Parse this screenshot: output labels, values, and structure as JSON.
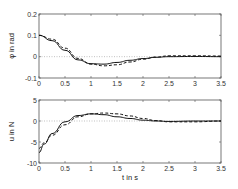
{
  "chart_data": [
    {
      "type": "line",
      "title": "",
      "xlabel": "",
      "ylabel": "φ in rad",
      "xlim": [
        0,
        3.5
      ],
      "ylim": [
        -0.1,
        0.2
      ],
      "xticks": [
        "0",
        "0.5",
        "1",
        "1.5",
        "2",
        "2.5",
        "3",
        "3.5"
      ],
      "yticks": [
        "-0.1",
        "0",
        "0.1",
        "0.2"
      ],
      "reference_line": {
        "y": 0,
        "style": "dotted"
      },
      "series": [
        {
          "name": "solid",
          "style": "solid",
          "x": [
            0,
            0.25,
            0.5,
            0.75,
            1.0,
            1.25,
            1.5,
            1.75,
            2.0,
            2.25,
            2.5,
            3.0,
            3.5
          ],
          "y": [
            0.1,
            0.075,
            0.03,
            -0.015,
            -0.033,
            -0.035,
            -0.027,
            -0.017,
            -0.009,
            -0.003,
            0.0,
            0.001,
            0.0
          ]
        },
        {
          "name": "dashed",
          "style": "dashed",
          "x": [
            0,
            0.25,
            0.5,
            0.75,
            1.0,
            1.25,
            1.5,
            1.75,
            2.0,
            2.25,
            2.5,
            3.0,
            3.5
          ],
          "y": [
            0.1,
            0.082,
            0.04,
            -0.008,
            -0.035,
            -0.043,
            -0.038,
            -0.025,
            -0.012,
            -0.002,
            0.004,
            0.004,
            0.003
          ]
        }
      ]
    },
    {
      "type": "line",
      "title": "",
      "xlabel": "t in s",
      "ylabel": "u in N",
      "xlim": [
        0,
        3.5
      ],
      "ylim": [
        -10,
        5
      ],
      "xticks": [
        "0",
        "0.5",
        "1",
        "1.5",
        "2",
        "2.5",
        "3",
        "3.5"
      ],
      "yticks": [
        "-10",
        "-5",
        "0",
        "5"
      ],
      "reference_line": {
        "y": 0,
        "style": "dotted"
      },
      "series": [
        {
          "name": "solid",
          "style": "solid",
          "x": [
            0,
            0.1,
            0.25,
            0.5,
            0.75,
            1.0,
            1.25,
            1.5,
            1.75,
            2.0,
            2.25,
            2.5,
            3.0,
            3.5
          ],
          "y": [
            -7.5,
            -5.5,
            -3,
            -0.2,
            1.3,
            1.7,
            1.5,
            1.0,
            0.6,
            0.2,
            0.0,
            -0.1,
            0.0,
            0.0
          ]
        },
        {
          "name": "dashed",
          "style": "dashed",
          "x": [
            0,
            0.1,
            0.25,
            0.5,
            0.75,
            1.0,
            1.25,
            1.5,
            1.75,
            2.0,
            2.25,
            2.5,
            3.0,
            3.5
          ],
          "y": [
            -6.5,
            -5.2,
            -3.4,
            -0.9,
            1.0,
            1.7,
            1.9,
            1.7,
            1.2,
            0.6,
            0.1,
            -0.2,
            -0.2,
            0.0
          ]
        }
      ]
    }
  ]
}
